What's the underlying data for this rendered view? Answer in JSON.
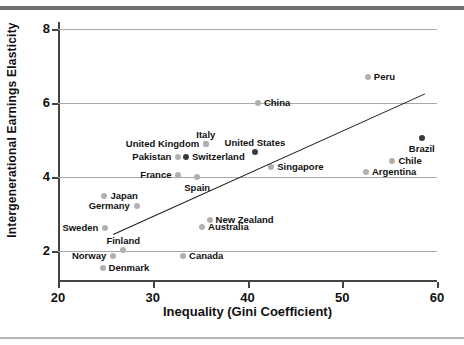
{
  "chart_data": {
    "type": "scatter",
    "title": "",
    "xlabel": "Inequality (Gini Coefficient)",
    "ylabel": "Intergenerational Earnings Elasticity",
    "xlim": [
      20,
      60
    ],
    "ylim": [
      1.2,
      8.2
    ],
    "xticks": [
      20,
      30,
      40,
      50,
      60
    ],
    "yticks": [
      2,
      4,
      6,
      8
    ],
    "grid": "horizontal",
    "legend": "none",
    "points": [
      {
        "label": "Peru",
        "x": 52.7,
        "y": 6.72,
        "shade": "light",
        "label_pos": "right"
      },
      {
        "label": "Brazil",
        "x": 58.4,
        "y": 5.07,
        "shade": "dark",
        "label_pos": "below"
      },
      {
        "label": "Chile",
        "x": 55.3,
        "y": 4.45,
        "shade": "light",
        "label_pos": "right"
      },
      {
        "label": "Argentina",
        "x": 52.5,
        "y": 4.15,
        "shade": "light",
        "label_pos": "right"
      },
      {
        "label": "China",
        "x": 41.1,
        "y": 6.0,
        "shade": "light",
        "label_pos": "right"
      },
      {
        "label": "Italy",
        "x": 35.6,
        "y": 4.9,
        "shade": "light",
        "label_pos": "above"
      },
      {
        "label": "United Kingdom",
        "x": 35.6,
        "y": 4.9,
        "shade": "light",
        "label_pos": "left"
      },
      {
        "label": "United States",
        "x": 40.8,
        "y": 4.7,
        "shade": "dark",
        "label_pos": "above"
      },
      {
        "label": "Switzerland",
        "x": 33.5,
        "y": 4.55,
        "shade": "dark",
        "label_pos": "right"
      },
      {
        "label": "Pakistan",
        "x": 32.7,
        "y": 4.55,
        "shade": "light",
        "label_pos": "left"
      },
      {
        "label": "Singapore",
        "x": 42.5,
        "y": 4.28,
        "shade": "light",
        "label_pos": "right"
      },
      {
        "label": "France",
        "x": 32.7,
        "y": 4.07,
        "shade": "light",
        "label_pos": "left"
      },
      {
        "label": "Spain",
        "x": 34.7,
        "y": 4.0,
        "shade": "light",
        "label_pos": "below"
      },
      {
        "label": "Japan",
        "x": 24.9,
        "y": 3.5,
        "shade": "light",
        "label_pos": "right"
      },
      {
        "label": "Germany",
        "x": 28.3,
        "y": 3.22,
        "shade": "light",
        "label_pos": "left"
      },
      {
        "label": "New Zealand",
        "x": 36.0,
        "y": 2.86,
        "shade": "light",
        "label_pos": "right"
      },
      {
        "label": "Australia",
        "x": 35.2,
        "y": 2.65,
        "shade": "light",
        "label_pos": "right"
      },
      {
        "label": "Sweden",
        "x": 25.0,
        "y": 2.62,
        "shade": "light",
        "label_pos": "left"
      },
      {
        "label": "Finland",
        "x": 26.9,
        "y": 2.05,
        "shade": "light",
        "label_pos": "above"
      },
      {
        "label": "Norway",
        "x": 25.8,
        "y": 1.88,
        "shade": "light",
        "label_pos": "left"
      },
      {
        "label": "Canada",
        "x": 33.2,
        "y": 1.88,
        "shade": "light",
        "label_pos": "right"
      },
      {
        "label": "Denmark",
        "x": 24.7,
        "y": 1.55,
        "shade": "light",
        "label_pos": "right"
      }
    ],
    "trendline": {
      "x0": 25.8,
      "y0": 2.47,
      "x1": 58.7,
      "y1": 6.27
    }
  },
  "colors": {
    "marker_light": "#b0b0b0",
    "marker_dark": "#3a3a3a",
    "gridline": "#a8a8a8",
    "axis": "#444444",
    "trendline": "#1b1b1b",
    "text": "#111111",
    "frame_top": "#6f6f6f",
    "frame_bottom": "#b5b5b5"
  }
}
